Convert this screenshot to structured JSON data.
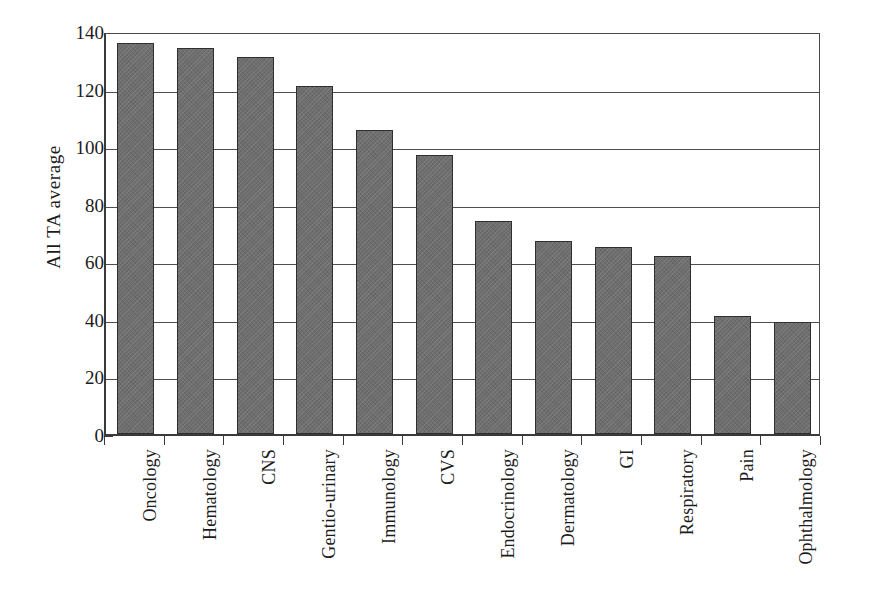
{
  "chart_data": {
    "type": "bar",
    "title": "",
    "subtitle": "",
    "xlabel": "",
    "ylabel": "All TA average",
    "ylim": [
      0,
      140
    ],
    "ytick_step": 20,
    "yticks": [
      "140",
      "120",
      "100",
      "80",
      "60",
      "40",
      "20",
      "0"
    ],
    "grid": true,
    "legend": "none",
    "orientation": "vertical",
    "categories": [
      "Oncology",
      "Hematology",
      "CNS",
      "Gentio-urinary",
      "Immunology",
      "CVS",
      "Endocrinology",
      "Dermatology",
      "GI",
      "Respiratory",
      "Pain",
      "Ophthalmology"
    ],
    "values": [
      136,
      134,
      131,
      121,
      105.5,
      97,
      74,
      67,
      65,
      62,
      41,
      39
    ],
    "series": [
      {
        "name": "All TA average",
        "values": [
          136,
          134,
          131,
          121,
          105.5,
          97,
          74,
          67,
          65,
          62,
          41,
          39
        ]
      }
    ],
    "colors": {
      "bar_fill": "#6e6e6e",
      "bar_border": "#2f2f2f",
      "gridline": "#4e4e4e",
      "axis": "#3a3a3a",
      "text": "#1c1c1c",
      "background": "#ffffff"
    }
  }
}
